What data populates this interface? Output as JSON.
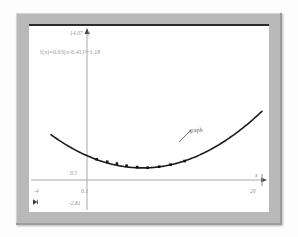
{
  "window": {
    "frame_color": "#b9b9b9",
    "canvas_color": "#ffffff"
  },
  "annotations": {
    "equation": "f(x)=0.03(x-6.41)²+1.18",
    "curve_label": "graph",
    "y_axis_symbol": "y",
    "x_axis_symbol": "x",
    "corner_icon": "expand-marker-icon"
  },
  "chart_data": {
    "type": "scatter",
    "title": "",
    "subtitle": "",
    "xlabel": "x",
    "ylabel": "y",
    "grid": false,
    "legend": "none",
    "equation": "f(x)=0.03(x-6.41)²+1.18",
    "xlim": [
      -4,
      20
    ],
    "ylim": [
      -2.81,
      14.07
    ],
    "xticks": [
      -4,
      0.1,
      20
    ],
    "xtick_labels": [
      "-4",
      "0.1",
      "20"
    ],
    "yticks": [
      -2.81,
      0.5,
      14.07
    ],
    "ytick_labels": [
      "-2.81",
      "0.5",
      "14.07"
    ],
    "x_axis_value": 0,
    "y_axis_value": 0.1,
    "vertex": {
      "x": 6.41,
      "y": 1.18
    },
    "coefficient": 0.03,
    "series": [
      {
        "name": "graph",
        "type": "line",
        "color": "#1e1e1e",
        "points_x": [
          -4,
          -2,
          0,
          2,
          4,
          6,
          8,
          10,
          12,
          14,
          16,
          18,
          20
        ],
        "points_y": [
          4.53,
          3.38,
          2.41,
          1.76,
          1.36,
          1.23,
          1.36,
          1.76,
          2.41,
          3.38,
          4.53,
          5.98,
          7.67
        ]
      },
      {
        "name": "data-points",
        "type": "scatter",
        "color": "#111111",
        "marker": "square",
        "points_x": [
          1.2,
          2.4,
          3.5,
          4.6,
          5.8,
          7.0,
          8.3,
          9.6,
          11.2
        ],
        "points_y": [
          2.02,
          1.78,
          1.6,
          1.4,
          1.26,
          1.2,
          1.3,
          1.5,
          1.85
        ]
      }
    ]
  }
}
